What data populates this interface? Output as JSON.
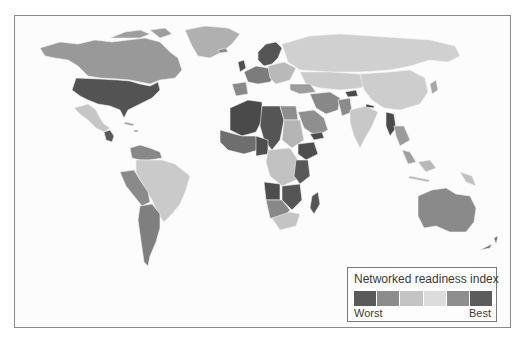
{
  "map": {
    "type": "choropleth",
    "region": "World",
    "colors": {
      "background": "#fcfcfc",
      "border": "#8a8a8a",
      "country_border": "#f4f4f4"
    }
  },
  "legend": {
    "title": "Networked readiness index",
    "low_label": "Worst",
    "high_label": "Best",
    "swatches": [
      "#5a5a5a",
      "#8c8c8c",
      "#c4c4c4",
      "#dcdcdc",
      "#8e8e8e",
      "#5c5c5c"
    ]
  }
}
